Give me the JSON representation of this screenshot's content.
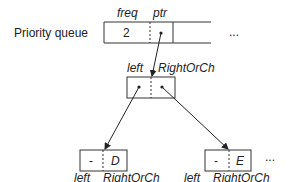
{
  "title_label": "Priority queue",
  "queue": {
    "field_labels": {
      "freq": "freq",
      "ptr": "ptr"
    },
    "freq_value": "2",
    "ellipsis": "..."
  },
  "internal_node": {
    "field_labels": {
      "left": "left",
      "right": "RightOrCh"
    }
  },
  "leaves": [
    {
      "left_value": "-",
      "right_value": "D",
      "left_label": "left",
      "right_label": "RightOrCh"
    },
    {
      "left_value": "-",
      "right_value": "E",
      "left_label": "left",
      "right_label": "RightOrCh"
    }
  ],
  "leaf_ellipsis": "..."
}
